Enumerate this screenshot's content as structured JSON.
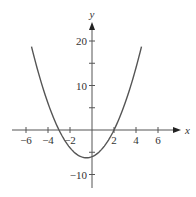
{
  "chart_data": {
    "type": "line",
    "title": "",
    "xlabel": "x",
    "ylabel": "y",
    "xlim": [
      -7.5,
      8
    ],
    "ylim": [
      -14,
      24
    ],
    "grid": false,
    "legend": null,
    "x_ticks": [
      -6,
      -4,
      -2,
      2,
      4,
      6
    ],
    "x_tick_labels": [
      "−6",
      "−4",
      "−2",
      "2",
      "4",
      "6"
    ],
    "y_ticks": [
      20,
      15,
      10,
      5,
      -5,
      -10
    ],
    "y_tick_labels": {
      "20": "20",
      "10": "10",
      "-10": "−10"
    },
    "series": [
      {
        "name": "y = x^2 + x - 6",
        "x": [
          -5.5,
          -5,
          -4,
          -3,
          -2,
          -1,
          -0.5,
          0,
          1,
          2,
          3,
          4,
          4.5
        ],
        "y": [
          18.75,
          14,
          6,
          0,
          -4,
          -6,
          -6.25,
          -6,
          -4,
          0,
          6,
          14,
          18.75
        ]
      }
    ],
    "annotations": []
  },
  "colors": {
    "curve": "#555555",
    "axes": "#555555",
    "text": "#333333"
  }
}
